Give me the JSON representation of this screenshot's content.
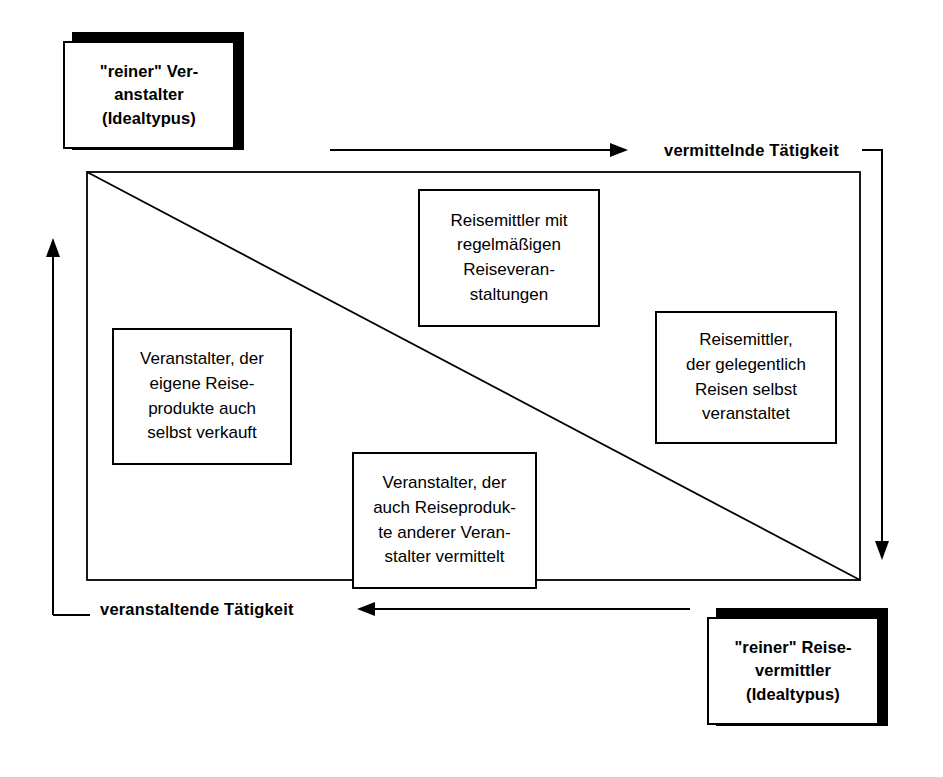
{
  "diagram": {
    "title_present": false,
    "ideal_types": [
      {
        "id": "reiner-veranstalter",
        "text": "\"reiner\" Ver-\nanstalter\n(Idealtypus)",
        "position": "top-left"
      },
      {
        "id": "reiner-reisevermittler",
        "text": "\"reiner\" Reise-\nvermittler\n(Idealtypus)",
        "position": "bottom-right"
      }
    ],
    "axes": [
      {
        "id": "vermittelnde",
        "label": "vermittelnde Tätigkeit",
        "direction": "right",
        "position": "top"
      },
      {
        "id": "veranstaltende",
        "label": "veranstaltende Tätigkeit",
        "direction": "left",
        "position": "bottom"
      }
    ],
    "categories": [
      {
        "id": "veranstalter-eigene",
        "text": "Veranstalter, der\neigene Reise-\nprodukte auch\nselbst verkauft"
      },
      {
        "id": "reisemittler-regelmaessig",
        "text": "Reisemittler mit\nregelmäßigen\nReiseveran-\nstaltungen"
      },
      {
        "id": "veranstalter-vermittelt",
        "text": "Veranstalter, der\nauch Reiseproduk-\nte anderer Veran-\nstalter vermittelt"
      },
      {
        "id": "reisemittler-gelegentlich",
        "text": "Reisemittler,\nder gelegentlich\nReisen selbst\nveranstaltet"
      }
    ],
    "colors": {
      "ink": "#000000",
      "paper": "#ffffff"
    }
  }
}
